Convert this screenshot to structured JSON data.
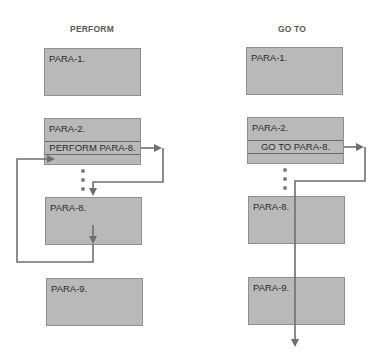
{
  "columns": [
    {
      "title": "PERFORM",
      "paragraphs": [
        {
          "label": "PARA-1."
        },
        {
          "label": "PARA-2.",
          "statement": "PERFORM PARA-8."
        },
        {
          "label": "PARA-8."
        },
        {
          "label": "PARA-9."
        }
      ]
    },
    {
      "title": "GO TO",
      "paragraphs": [
        {
          "label": "PARA-1."
        },
        {
          "label": "PARA-2.",
          "statement": "GO TO PARA-8."
        },
        {
          "label": "PARA-8."
        },
        {
          "label": "PARA-9."
        }
      ]
    }
  ],
  "colors": {
    "box_fill": "#b9b9b9",
    "box_border": "#8f8f8f",
    "arrow": "#6f6f6f",
    "title": "#5a5a5a"
  }
}
